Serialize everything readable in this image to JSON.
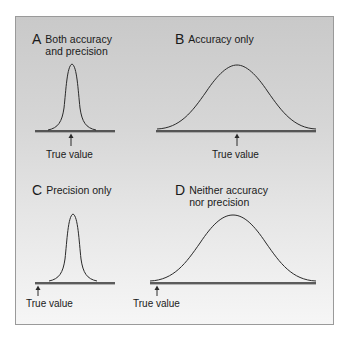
{
  "figure": {
    "panels": [
      {
        "letter": "A",
        "title_line1": "Both accuracy",
        "title_line2": "and precision",
        "true_value_label": "True value",
        "curve": "narrow",
        "true_value_position": "centered"
      },
      {
        "letter": "B",
        "title_line1": "Accuracy only",
        "title_line2": "",
        "true_value_label": "True value",
        "curve": "wide",
        "true_value_position": "centered"
      },
      {
        "letter": "C",
        "title_line1": "Precision only",
        "title_line2": "",
        "true_value_label": "True value",
        "curve": "narrow",
        "true_value_position": "left-offset"
      },
      {
        "letter": "D",
        "title_line1": "Neither accuracy",
        "title_line2": "nor precision",
        "true_value_label": "True value",
        "curve": "wide",
        "true_value_position": "left-offset"
      }
    ],
    "colors": {
      "background_top": "#c9c9c9",
      "background_bottom": "#f6f6f6",
      "line": "#2a2a2a",
      "text": "#1a1a1a"
    }
  }
}
